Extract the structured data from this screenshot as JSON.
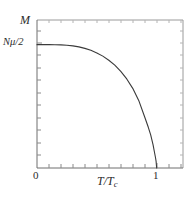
{
  "chart_data": {
    "type": "line",
    "title": "",
    "xlabel": "T/Tc",
    "ylabel": "M",
    "xlim": [
      0,
      1.22
    ],
    "ylim": [
      0,
      1.2
    ],
    "grid": false,
    "legend": null,
    "x_ticks": [
      {
        "value": 0,
        "label": "0"
      },
      {
        "value": 1,
        "label": "1"
      }
    ],
    "y_ticks": [
      {
        "value": 1,
        "label": "Nμ/2"
      }
    ],
    "x_minor_tick_step": 0.1,
    "y_minor_tick_step": 0.1,
    "series": [
      {
        "name": "magnetization",
        "x": [
          0.0,
          0.05,
          0.1,
          0.15,
          0.2,
          0.25,
          0.3,
          0.35,
          0.4,
          0.45,
          0.5,
          0.55,
          0.6,
          0.65,
          0.7,
          0.75,
          0.8,
          0.85,
          0.9,
          0.93,
          0.95,
          0.97,
          0.98,
          0.99,
          0.995,
          1.0
        ],
        "y": [
          1.0,
          1.0,
          1.0,
          0.999,
          0.998,
          0.995,
          0.99,
          0.982,
          0.97,
          0.954,
          0.933,
          0.907,
          0.874,
          0.834,
          0.784,
          0.722,
          0.646,
          0.548,
          0.414,
          0.33,
          0.268,
          0.188,
          0.136,
          0.085,
          0.056,
          0.0
        ]
      }
    ]
  },
  "labels": {
    "y_axis_title": "M",
    "y_max_tick": "Nμ/2",
    "x_axis_title_num": "T",
    "x_axis_title_den": "T",
    "x_axis_title_sub": "c",
    "x_tick_0": "0",
    "x_tick_1": "1"
  },
  "style": {
    "curve_color": "#3a3a3a",
    "axis_color": "#8a8a8a",
    "text_color": "#2b2b2b",
    "background": "#ffffff"
  }
}
